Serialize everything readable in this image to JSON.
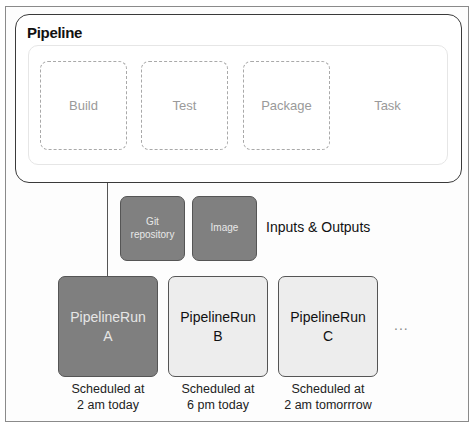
{
  "pipeline": {
    "title": "Pipeline",
    "tasks": [
      {
        "label": "Build",
        "style": "dashed"
      },
      {
        "label": "Test",
        "style": "dashed"
      },
      {
        "label": "Package",
        "style": "dashed"
      },
      {
        "label": "Task",
        "style": "none"
      }
    ]
  },
  "resources": {
    "items": [
      {
        "line1": "Git",
        "line2": "repository"
      },
      {
        "line1": "Image",
        "line2": ""
      }
    ],
    "label": "Inputs & Outputs"
  },
  "runs": [
    {
      "title": "PipelineRun",
      "id": "A",
      "schedule_line1": "Scheduled at",
      "schedule_line2": "2 am today",
      "state": "active"
    },
    {
      "title": "PipelineRun",
      "id": "B",
      "schedule_line1": "Scheduled at",
      "schedule_line2": "6 pm today",
      "state": "idle"
    },
    {
      "title": "PipelineRun",
      "id": "C",
      "schedule_line1": "Scheduled at",
      "schedule_line2": "2 am tomorrrow",
      "state": "idle"
    }
  ],
  "more": "...",
  "colors": {
    "active_fill": "#7f7f7f",
    "idle_fill": "#ededed",
    "border": "#555555"
  }
}
